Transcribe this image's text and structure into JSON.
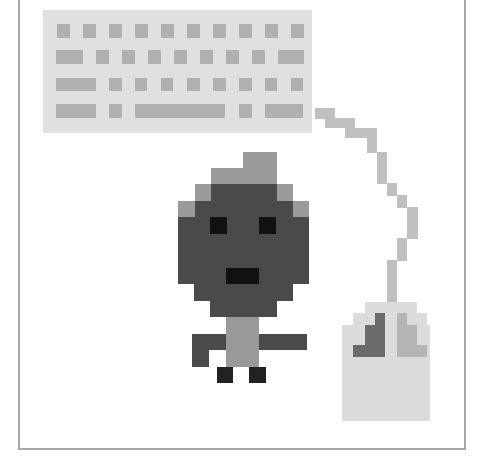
{
  "illustration": {
    "title": "Pixel art: person at computer with keyboard and mouse",
    "colors": {
      "background": "#ffffff",
      "frame": "#a8a8a8",
      "keyboard_body": "#e0e0e0",
      "keyboard_key": "#b0b0b0",
      "cord": "#c0c0c0",
      "mouse_body": "#dcdcdc",
      "mouse_left_button": "#6b6b6b",
      "mouse_right_button": "#b5b5b5",
      "hair": "#9a9a9a",
      "head": "#4a4a4a",
      "face_feature": "#111111",
      "body": "#999999",
      "arm": "#4a4a4a",
      "foot": "#222222"
    },
    "keyboard": {
      "body": {
        "x": 43,
        "y": 10,
        "w": 269,
        "h": 123,
        "color": "keyboard_body"
      },
      "rows": [
        {
          "y": 24,
          "h": 14,
          "keys": [
            [
              57,
              13
            ],
            [
              83,
              13
            ],
            [
              109,
              13
            ],
            [
              135,
              13
            ],
            [
              161,
              13
            ],
            [
              187,
              13
            ],
            [
              213,
              13
            ],
            [
              239,
              13
            ],
            [
              265,
              13
            ],
            [
              291,
              13
            ]
          ]
        },
        {
          "y": 50,
          "h": 14,
          "keys": [
            [
              56,
              27
            ],
            [
              96,
              13
            ],
            [
              122,
              13
            ],
            [
              148,
              13
            ],
            [
              174,
              13
            ],
            [
              200,
              13
            ],
            [
              226,
              13
            ],
            [
              252,
              13
            ],
            [
              278,
              26
            ]
          ]
        },
        {
          "y": 78,
          "h": 13,
          "keys": [
            [
              56,
              40
            ],
            [
              109,
              13
            ],
            [
              135,
              12
            ],
            [
              161,
              12
            ],
            [
              187,
              13
            ],
            [
              213,
              13
            ],
            [
              239,
              13
            ],
            [
              265,
              12
            ],
            [
              291,
              12
            ]
          ]
        },
        {
          "y": 104,
          "h": 14,
          "keys": [
            [
              56,
              40
            ],
            [
              109,
              13
            ],
            [
              135,
              90
            ],
            [
              239,
              13
            ],
            [
              265,
              38
            ]
          ]
        }
      ]
    },
    "cord": [
      {
        "x": 315,
        "y": 108,
        "w": 20,
        "h": 11
      },
      {
        "x": 325,
        "y": 118,
        "w": 30,
        "h": 10
      },
      {
        "x": 345,
        "y": 128,
        "w": 32,
        "h": 10
      },
      {
        "x": 367,
        "y": 137,
        "w": 10,
        "h": 16
      },
      {
        "x": 377,
        "y": 152,
        "w": 10,
        "h": 32
      },
      {
        "x": 387,
        "y": 183,
        "w": 10,
        "h": 13
      },
      {
        "x": 397,
        "y": 195,
        "w": 10,
        "h": 13
      },
      {
        "x": 407,
        "y": 207,
        "w": 11,
        "h": 32
      },
      {
        "x": 397,
        "y": 238,
        "w": 10,
        "h": 23
      },
      {
        "x": 387,
        "y": 260,
        "w": 10,
        "h": 43
      }
    ],
    "mouse": {
      "body": [
        {
          "x": 365,
          "y": 302,
          "w": 52,
          "h": 12
        },
        {
          "x": 353,
          "y": 313,
          "w": 74,
          "h": 13
        },
        {
          "x": 342,
          "y": 325,
          "w": 88,
          "h": 96
        }
      ],
      "left_button": [
        {
          "x": 375,
          "y": 313,
          "w": 10,
          "h": 13
        },
        {
          "x": 365,
          "y": 325,
          "w": 20,
          "h": 21
        },
        {
          "x": 353,
          "y": 345,
          "w": 32,
          "h": 12
        }
      ],
      "right_button": [
        {
          "x": 397,
          "y": 313,
          "w": 10,
          "h": 13
        },
        {
          "x": 397,
          "y": 325,
          "w": 20,
          "h": 21
        },
        {
          "x": 397,
          "y": 345,
          "w": 30,
          "h": 12
        }
      ]
    },
    "person": {
      "hair": [
        {
          "x": 243,
          "y": 152,
          "w": 34,
          "h": 17
        },
        {
          "x": 211,
          "y": 168,
          "w": 66,
          "h": 17
        },
        {
          "x": 195,
          "y": 184,
          "w": 16,
          "h": 17
        },
        {
          "x": 277,
          "y": 184,
          "w": 16,
          "h": 17
        },
        {
          "x": 178,
          "y": 201,
          "w": 17,
          "h": 17
        },
        {
          "x": 293,
          "y": 201,
          "w": 16,
          "h": 17
        }
      ],
      "head": [
        {
          "x": 211,
          "y": 184,
          "w": 66,
          "h": 17
        },
        {
          "x": 195,
          "y": 201,
          "w": 98,
          "h": 17
        },
        {
          "x": 178,
          "y": 217,
          "w": 131,
          "h": 67
        },
        {
          "x": 194,
          "y": 283,
          "w": 99,
          "h": 18
        },
        {
          "x": 210,
          "y": 300,
          "w": 67,
          "h": 17
        }
      ],
      "eyes": [
        {
          "x": 210,
          "y": 217,
          "w": 17,
          "h": 17
        },
        {
          "x": 259,
          "y": 217,
          "w": 17,
          "h": 17
        }
      ],
      "mouth": [
        {
          "x": 226,
          "y": 268,
          "w": 33,
          "h": 16
        }
      ],
      "body": [
        {
          "x": 226,
          "y": 317,
          "w": 33,
          "h": 50
        }
      ],
      "arms": [
        {
          "x": 192,
          "y": 334,
          "w": 34,
          "h": 16
        },
        {
          "x": 192,
          "y": 349,
          "w": 17,
          "h": 18
        },
        {
          "x": 259,
          "y": 334,
          "w": 48,
          "h": 16
        }
      ],
      "feet": [
        {
          "x": 217,
          "y": 367,
          "w": 16,
          "h": 16
        },
        {
          "x": 249,
          "y": 367,
          "w": 17,
          "h": 16
        }
      ]
    }
  }
}
